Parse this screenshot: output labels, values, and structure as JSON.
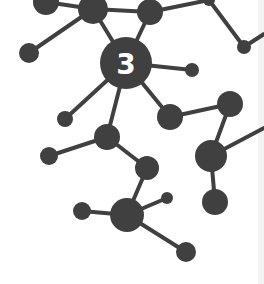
{
  "diagram": {
    "type": "molecule-network",
    "center_label": "3",
    "colors": {
      "node": "#404040",
      "edge": "#404040",
      "label": "#ffffff",
      "background": "#ffffff"
    },
    "nodes": [
      {
        "id": "n1",
        "x": 46,
        "y": 2,
        "r": 13
      },
      {
        "id": "n2",
        "x": 93,
        "y": 9,
        "r": 15
      },
      {
        "id": "n3",
        "x": 150,
        "y": 12,
        "r": 13
      },
      {
        "id": "n4",
        "x": 209,
        "y": 0,
        "r": 6
      },
      {
        "id": "n5",
        "x": 29,
        "y": 53,
        "r": 10
      },
      {
        "id": "c",
        "x": 126,
        "y": 63,
        "r": 26,
        "label": "3"
      },
      {
        "id": "n6",
        "x": 192,
        "y": 70,
        "r": 7
      },
      {
        "id": "n7",
        "x": 244,
        "y": 47,
        "r": 7
      },
      {
        "id": "n8",
        "x": 65,
        "y": 119,
        "r": 8
      },
      {
        "id": "n9",
        "x": 107,
        "y": 137,
        "r": 13
      },
      {
        "id": "n10",
        "x": 170,
        "y": 117,
        "r": 13
      },
      {
        "id": "n11",
        "x": 230,
        "y": 104,
        "r": 13
      },
      {
        "id": "n12",
        "x": 211,
        "y": 156,
        "r": 16
      },
      {
        "id": "n13",
        "x": 215,
        "y": 202,
        "r": 13
      },
      {
        "id": "n14",
        "x": 49,
        "y": 156,
        "r": 9
      },
      {
        "id": "n15",
        "x": 147,
        "y": 168,
        "r": 12
      },
      {
        "id": "n16",
        "x": 127,
        "y": 215,
        "r": 17
      },
      {
        "id": "n17",
        "x": 167,
        "y": 198,
        "r": 6
      },
      {
        "id": "n18",
        "x": 82,
        "y": 211,
        "r": 9
      },
      {
        "id": "n19",
        "x": 186,
        "y": 252,
        "r": 10
      }
    ],
    "edges": [
      [
        "n1",
        "n2"
      ],
      [
        "n2",
        "n3"
      ],
      [
        "n3",
        "n4"
      ],
      [
        "n2",
        "n5"
      ],
      [
        "n2",
        "c"
      ],
      [
        "n3",
        "c"
      ],
      [
        "c",
        "n6"
      ],
      [
        "c",
        "n8"
      ],
      [
        "c",
        "n9"
      ],
      [
        "c",
        "n10"
      ],
      [
        "n10",
        "n11"
      ],
      [
        "n11",
        "n12"
      ],
      [
        "n12",
        "n13"
      ],
      [
        "n12",
        "edgeR"
      ],
      [
        "n4",
        "n7"
      ],
      [
        "n7",
        "edgeR2"
      ],
      [
        "n9",
        "n14"
      ],
      [
        "n9",
        "n15"
      ],
      [
        "n15",
        "n16"
      ],
      [
        "n16",
        "n17"
      ],
      [
        "n16",
        "n18"
      ],
      [
        "n16",
        "n19"
      ]
    ],
    "offscreen_points": {
      "edgeR": {
        "x": 264,
        "y": 128
      },
      "edgeR2": {
        "x": 264,
        "y": 34
      }
    }
  }
}
